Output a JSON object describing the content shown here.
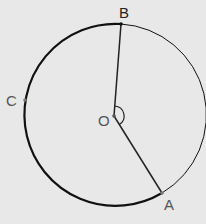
{
  "diagram": {
    "type": "circle-geometry",
    "center": {
      "label": "O",
      "x": 114,
      "y": 116
    },
    "radius": 91,
    "points": [
      {
        "label": "B",
        "x": 121,
        "y": 24
      },
      {
        "label": "C",
        "x": 25,
        "y": 100
      },
      {
        "label": "A",
        "x": 162,
        "y": 193
      }
    ],
    "segments": [
      {
        "from": "O",
        "to": "B"
      },
      {
        "from": "O",
        "to": "A"
      }
    ],
    "arcs": [
      {
        "from": "B",
        "to": "A",
        "via": "C",
        "style": "thick"
      },
      {
        "from": "B",
        "to": "A",
        "via": "right",
        "style": "thin"
      }
    ],
    "angle_mark": {
      "vertex": "O",
      "between": [
        "B",
        "A"
      ],
      "side": "reflex-right"
    },
    "colors": {
      "background": "#e8e8e8",
      "stroke": "#111111",
      "label": "#555555"
    }
  },
  "labels": {
    "B": "B",
    "C": "C",
    "O": "O",
    "A": "A"
  }
}
